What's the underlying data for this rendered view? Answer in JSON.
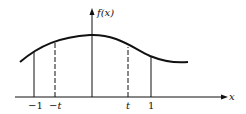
{
  "diagram": {
    "y_axis_label": "f(x)",
    "x_axis_label": "x",
    "ticks": [
      {
        "label": "−1",
        "x": 34,
        "style": "solid"
      },
      {
        "label": "−t",
        "x": 55,
        "style": "dashed"
      },
      {
        "label": "t",
        "x": 128,
        "style": "dashed"
      },
      {
        "label": "1",
        "x": 151,
        "style": "solid"
      }
    ],
    "colors": {
      "ink": "#111111",
      "background": "#ffffff"
    }
  }
}
